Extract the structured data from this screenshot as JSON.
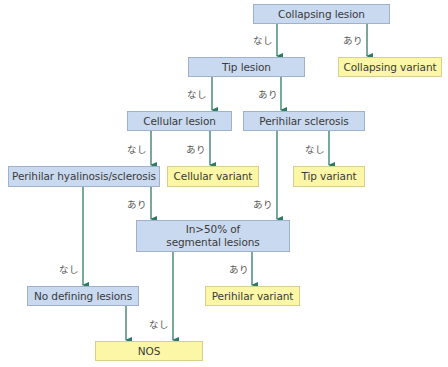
{
  "nodes": {
    "collapsing_lesion": "Collapsing lesion",
    "tip_lesion": "Tip lesion",
    "collapsing_variant": "Collapsing variant",
    "cellular_lesion": "Cellular lesion",
    "perihilar_sclerosis": "Perihilar sclerosis",
    "perihilar_hyalinosis": "Perihilar hyalinosis/sclerosis",
    "cellular_variant": "Cellular variant",
    "tip_variant": "Tip variant",
    "segmental_line1": "In>50% of",
    "segmental_line2": "segmental lesions",
    "no_defining": "No defining lesions",
    "perihilar_variant": "Perihilar variant",
    "nos": "NOS"
  },
  "edge_labels": {
    "no": "なし",
    "yes": "あり"
  },
  "colors": {
    "question_fill": "#c9d9ef",
    "result_fill": "#fbf7a6",
    "arrow": "#2f7a64"
  }
}
